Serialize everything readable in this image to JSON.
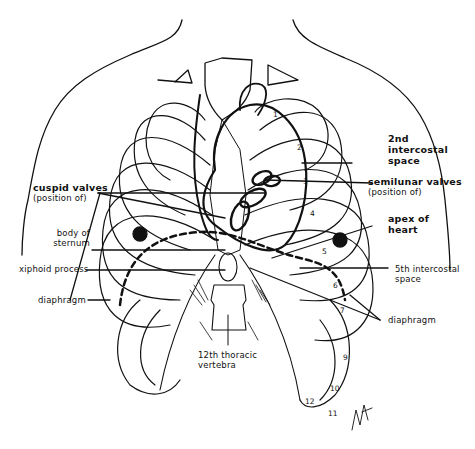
{
  "diagram": {
    "colors": {
      "ink": "#111111",
      "background": "#ffffff"
    },
    "labels": {
      "second_intercostal": {
        "line1": "2nd",
        "line2": "intercostal",
        "line3": "space"
      },
      "cuspid_valves": {
        "title": "cuspid valves",
        "sub": "(position of)"
      },
      "semilunar_valves": {
        "title": "semilunar valves",
        "sub": "(position of)"
      },
      "body_of_sternum": {
        "line1": "body of",
        "line2": "sternum"
      },
      "apex_of_heart": {
        "line1": "apex of",
        "line2": "heart"
      },
      "xiphoid_process": "xiphoid process",
      "fifth_intercostal": {
        "line1": "5th intercostal",
        "line2": "space"
      },
      "diaphragm_left": "diaphragm",
      "diaphragm_right": "diaphragm",
      "twelfth_thoracic": {
        "line1": "12th thoracic",
        "line2": "vertebra"
      }
    },
    "rib_numbers": [
      "1",
      "2",
      "3",
      "4",
      "5",
      "6",
      "7",
      "9",
      "10",
      "11",
      "12"
    ]
  }
}
